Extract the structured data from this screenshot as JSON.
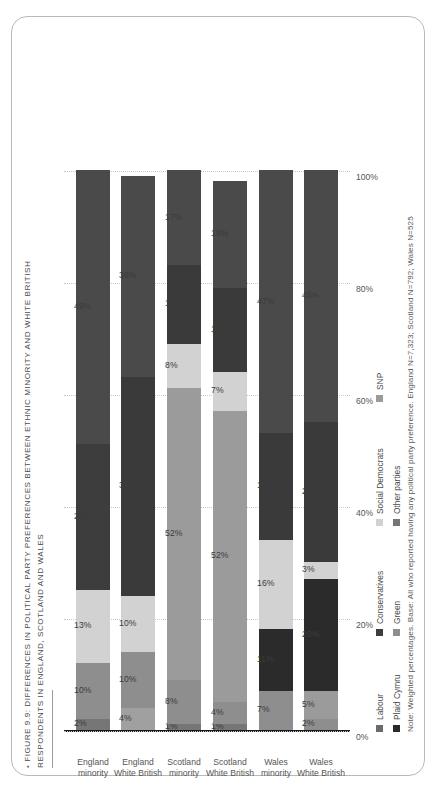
{
  "figure": {
    "bullet": "•",
    "title_line1": "FIGURE 9.9: DIFFERENCES IN POLITICAL PARTY PREFERENCES BETWEEN ETHNIC MINORITY AND WHITE BRITISH",
    "title_line2": "RESPONDENTS IN ENGLAND, SCOTLAND AND WALES",
    "note": "Note: Weighted percentages. Base: All who reported having any political party preference. England N=7,323; Scotland N=792; Wales N=525"
  },
  "legend": {
    "items": [
      {
        "label": "Labour",
        "color": "#6b6b6b"
      },
      {
        "label": "Plaid Cymru",
        "color": "#2b2b2b"
      },
      {
        "label": "Conservatives",
        "color": "#3d3d3d"
      },
      {
        "label": "Green",
        "color": "#8e8e8e"
      },
      {
        "label": "Social Democrats",
        "color": "#d2d2d2"
      },
      {
        "label": "Other parties",
        "color": "#767676"
      },
      {
        "label": "SNP",
        "color": "#9b9b9b"
      }
    ]
  },
  "chart_data": {
    "type": "bar",
    "orientation": "horizontal-stacked",
    "title": "FIGURE 9.9: DIFFERENCES IN POLITICAL PARTY PREFERENCES BETWEEN ETHNIC MINORITY AND WHITE BRITISH RESPONDENTS IN ENGLAND, SCOTLAND AND WALES",
    "xlabel": "",
    "ylabel": "",
    "xlim": [
      0,
      100
    ],
    "grid": true,
    "legend_position": "bottom",
    "tick_labels": [
      "0%",
      "20%",
      "40%",
      "60%",
      "80%",
      "100%"
    ],
    "tick_values": [
      0,
      20,
      40,
      60,
      80,
      100
    ],
    "categories": [
      "England\nminority",
      "England\nWhite British",
      "Scotland\nminority",
      "Scotland\nWhite British",
      "Wales\nminority",
      "Wales\nWhite British"
    ],
    "series": [
      {
        "name": "Labour",
        "color": "#6b6b6b",
        "values": [
          49,
          36,
          17,
          19,
          47,
          45
        ]
      },
      {
        "name": "Conservatives",
        "color": "#3d3d3d",
        "values": [
          26,
          39,
          14,
          15,
          19,
          25
        ]
      },
      {
        "name": "Social Democrats",
        "color": "#d2d2d2",
        "values": [
          13,
          10,
          8,
          7,
          16,
          3
        ]
      },
      {
        "name": "SNP",
        "color": "#9b9b9b",
        "values": [
          0,
          0,
          52,
          52,
          0,
          0
        ]
      },
      {
        "name": "Plaid Cymru",
        "color": "#2b2b2b",
        "values": [
          0,
          0,
          0,
          0,
          11,
          20
        ]
      },
      {
        "name": "Green",
        "color": "#8e8e8e",
        "values": [
          10,
          10,
          8,
          4,
          7,
          5
        ]
      },
      {
        "name": "Other parties",
        "color": "#767676",
        "values": [
          2,
          4,
          1,
          1,
          0,
          2
        ]
      }
    ],
    "bars": [
      {
        "category": "England\nminority",
        "segments": [
          {
            "series": "Other parties",
            "value": 2,
            "label": "2%",
            "color": "#767676"
          },
          {
            "series": "Green",
            "value": 10,
            "label": "10%",
            "color": "#8e8e8e"
          },
          {
            "series": "Social Democrats",
            "value": 13,
            "label": "13%",
            "color": "#d2d2d2"
          },
          {
            "series": "Conservatives",
            "value": 26,
            "label": "26%",
            "color": "#3d3d3d"
          },
          {
            "series": "Labour",
            "value": 49,
            "label": "49%",
            "color": "#4a4a4a"
          }
        ]
      },
      {
        "category": "England\nWhite British",
        "segments": [
          {
            "series": "Other parties",
            "value": 4,
            "label": "4%",
            "color": "#a0a0a0"
          },
          {
            "series": "Green",
            "value": 10,
            "label": "10%",
            "color": "#8e8e8e"
          },
          {
            "series": "Social Democrats",
            "value": 10,
            "label": "10%",
            "color": "#d2d2d2"
          },
          {
            "series": "Conservatives",
            "value": 39,
            "label": "39%",
            "color": "#3a3a3a"
          },
          {
            "series": "Labour",
            "value": 36,
            "label": "36%",
            "color": "#4a4a4a"
          }
        ]
      },
      {
        "category": "Scotland\nminority",
        "segments": [
          {
            "series": "Other parties",
            "value": 1,
            "label": "1%",
            "color": "#767676"
          },
          {
            "series": "Green",
            "value": 8,
            "label": "8%",
            "color": "#8e8e8e"
          },
          {
            "series": "SNP",
            "value": 52,
            "label": "52%",
            "color": "#9b9b9b"
          },
          {
            "series": "Social Democrats",
            "value": 8,
            "label": "8%",
            "color": "#d2d2d2"
          },
          {
            "series": "Conservatives",
            "value": 14,
            "label": "14%",
            "color": "#3a3a3a"
          },
          {
            "series": "Labour",
            "value": 17,
            "label": "17%",
            "color": "#4a4a4a"
          }
        ]
      },
      {
        "category": "Scotland\nWhite British",
        "segments": [
          {
            "series": "Other parties",
            "value": 1,
            "label": "1%",
            "color": "#767676"
          },
          {
            "series": "Green",
            "value": 4,
            "label": "4%",
            "color": "#8e8e8e"
          },
          {
            "series": "SNP",
            "value": 52,
            "label": "52%",
            "color": "#9b9b9b"
          },
          {
            "series": "Social Democrats",
            "value": 7,
            "label": "7%",
            "color": "#d2d2d2"
          },
          {
            "series": "Conservatives",
            "value": 15,
            "label": "15%",
            "color": "#3a3a3a"
          },
          {
            "series": "Labour",
            "value": 19,
            "label": "19%",
            "color": "#4a4a4a"
          }
        ]
      },
      {
        "category": "Wales\nminority",
        "segments": [
          {
            "series": "Green",
            "value": 7,
            "label": "7%",
            "color": "#8e8e8e"
          },
          {
            "series": "Plaid Cymru",
            "value": 11,
            "label": "11%",
            "color": "#2b2b2b"
          },
          {
            "series": "Social Democrats",
            "value": 16,
            "label": "16%",
            "color": "#d2d2d2"
          },
          {
            "series": "Conservatives",
            "value": 19,
            "label": "19%",
            "color": "#3a3a3a"
          },
          {
            "series": "Labour",
            "value": 47,
            "label": "47%",
            "color": "#4a4a4a"
          }
        ]
      },
      {
        "category": "Wales\nWhite British",
        "segments": [
          {
            "series": "Other parties",
            "value": 2,
            "label": "2%",
            "color": "#8e8e8e"
          },
          {
            "series": "Green",
            "value": 5,
            "label": "5%",
            "color": "#9b9b9b"
          },
          {
            "series": "Plaid Cymru",
            "value": 20,
            "label": "20%",
            "color": "#2b2b2b"
          },
          {
            "series": "Social Democrats",
            "value": 3,
            "label": "3%",
            "color": "#d2d2d2"
          },
          {
            "series": "Conservatives",
            "value": 25,
            "label": "25%",
            "color": "#3a3a3a"
          },
          {
            "series": "Labour",
            "value": 45,
            "label": "45%",
            "color": "#4a4a4a"
          }
        ]
      }
    ]
  }
}
